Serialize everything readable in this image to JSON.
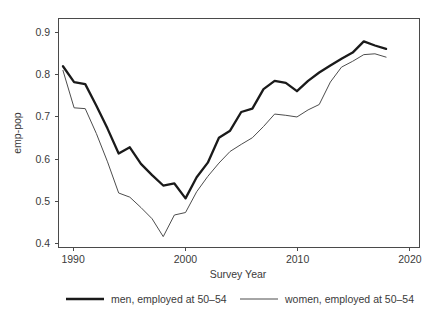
{
  "chart_data": {
    "type": "line",
    "title": "",
    "xlabel": "Survey Year",
    "ylabel": "emp-pop",
    "xlim": [
      1988.6,
      2021.0
    ],
    "ylim": [
      0.375,
      0.925
    ],
    "grid": false,
    "legend_position": "bottom",
    "xticks": [
      1990,
      2000,
      2010,
      2020
    ],
    "xtick_labels": [
      "1990",
      "2000",
      "2010",
      "2020"
    ],
    "yticks": [
      0.4,
      0.5,
      0.6,
      0.7,
      0.8,
      0.9
    ],
    "ytick_labels": [
      "0.4",
      "0.5",
      "0.6",
      "0.7",
      "0.8",
      "0.9"
    ],
    "x": [
      1989,
      1990,
      1991,
      1992,
      1993,
      1994,
      1995,
      1996,
      1997,
      1998,
      1999,
      2000,
      2001,
      2002,
      2003,
      2004,
      2005,
      2006,
      2007,
      2008,
      2009,
      2010,
      2011,
      2012,
      2013,
      2014,
      2015,
      2016,
      2017,
      2018
    ],
    "series": [
      {
        "name": "men, employed at 50–54",
        "style": "thick",
        "color": "#1a1a1a",
        "values": [
          0.81,
          0.772,
          0.767,
          0.715,
          0.66,
          0.6,
          0.615,
          0.575,
          0.548,
          0.523,
          0.528,
          0.492,
          0.543,
          0.578,
          0.638,
          0.655,
          0.7,
          0.708,
          0.755,
          0.775,
          0.77,
          0.75,
          0.775,
          0.795,
          0.812,
          0.828,
          0.843,
          0.87,
          0.86,
          0.852
        ]
      },
      {
        "name": "women, employed at 50–54",
        "style": "thin",
        "color": "#4d4d4d",
        "values": [
          0.8,
          0.71,
          0.708,
          0.648,
          0.58,
          0.505,
          0.495,
          0.47,
          0.443,
          0.4,
          0.452,
          0.458,
          0.508,
          0.545,
          0.577,
          0.605,
          0.622,
          0.638,
          0.665,
          0.695,
          0.692,
          0.688,
          0.705,
          0.718,
          0.772,
          0.808,
          0.822,
          0.838,
          0.84,
          0.832
        ]
      }
    ]
  },
  "axis": {
    "ylabel": "emp-pop",
    "xlabel": "Survey Year"
  },
  "legend": {
    "entries": [
      {
        "label": "men, employed at 50–54"
      },
      {
        "label": "women, employed at 50–54"
      }
    ]
  }
}
